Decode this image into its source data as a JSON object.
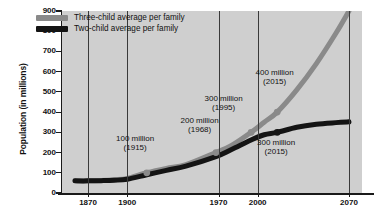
{
  "chart_data": {
    "type": "line",
    "title": "",
    "xlabel": "",
    "ylabel": "Population (in millions)",
    "xlim": [
      1850,
      2080
    ],
    "ylim": [
      0,
      900
    ],
    "grid": "vertical-only",
    "legend_position": "top-left-inside",
    "xticks": [
      1870,
      1900,
      1970,
      2000,
      2070
    ],
    "yticks": [
      0,
      100,
      200,
      300,
      400,
      500,
      600,
      700,
      800,
      900
    ],
    "series": [
      {
        "name": "Three-child average per family",
        "color": "#8a8a8a",
        "x": [
          1860,
          1870,
          1880,
          1890,
          1900,
          1915,
          1930,
          1945,
          1968,
          1980,
          1995,
          2005,
          2015,
          2030,
          2045,
          2060,
          2070
        ],
        "values": [
          60,
          60,
          62,
          66,
          72,
          100,
          122,
          140,
          200,
          235,
          300,
          350,
          400,
          510,
          640,
          790,
          900
        ]
      },
      {
        "name": "Two-child average per family",
        "color": "#141414",
        "x": [
          1860,
          1870,
          1880,
          1890,
          1900,
          1915,
          1930,
          1945,
          1968,
          1980,
          1995,
          2005,
          2015,
          2030,
          2045,
          2060,
          2070
        ],
        "values": [
          60,
          60,
          61,
          63,
          68,
          90,
          112,
          133,
          180,
          215,
          262,
          288,
          300,
          325,
          340,
          348,
          352
        ]
      }
    ],
    "annotations": [
      {
        "line1": "100 million",
        "line2": "(1915)",
        "x": 1915,
        "y": 100,
        "label_left_pct": 18.0,
        "label_top_pct": 68.0
      },
      {
        "line1": "200 million",
        "line2": "(1968)",
        "x": 1968,
        "y": 200,
        "label_left_pct": 39.5,
        "label_top_pct": 58.0
      },
      {
        "line1": "300 million",
        "line2": "(1995)",
        "x": 1995,
        "y": 300,
        "label_left_pct": 47.5,
        "label_top_pct": 46.0
      },
      {
        "line1": "400 million",
        "line2": "(2015)",
        "x": 2015,
        "y": 400,
        "label_left_pct": 64.5,
        "label_top_pct": 32.0
      },
      {
        "line1": "300 million",
        "line2": "(2015)",
        "x": 2015,
        "y": 300,
        "label_left_pct": 65.0,
        "label_top_pct": 70.5
      }
    ],
    "markers": [
      {
        "series": "Three-child average per family",
        "x": 1915,
        "y": 100
      },
      {
        "series": "Three-child average per family",
        "x": 1968,
        "y": 200
      },
      {
        "series": "Three-child average per family",
        "x": 1995,
        "y": 300
      },
      {
        "series": "Three-child average per family",
        "x": 2015,
        "y": 400
      },
      {
        "series": "Two-child average per family",
        "x": 2015,
        "y": 300
      }
    ]
  },
  "colors": {
    "plot_background": "#cfcfcf",
    "page_background": "#ffffff",
    "axis": "#1a1a1a",
    "gridline": "#3a3a3a",
    "three_child": "#8a8a8a",
    "two_child": "#141414"
  }
}
